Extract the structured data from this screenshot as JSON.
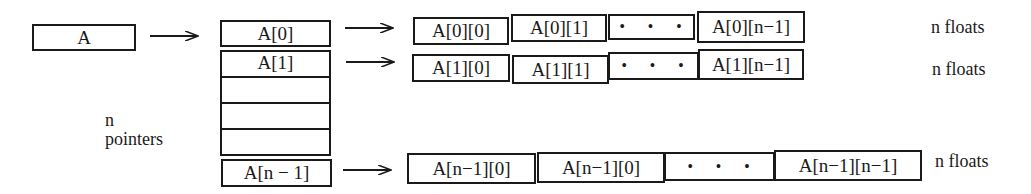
{
  "diagram": {
    "root": {
      "label": "A"
    },
    "pointer_array": {
      "cells": [
        "A[0]",
        "A[1]",
        "",
        "",
        "",
        "A[n − 1]"
      ],
      "caption_line1": "n",
      "caption_line2": "pointers"
    },
    "rows": [
      {
        "cells": [
          "A[0][0]",
          "A[0][1]",
          "• • •",
          "A[0][n−1]"
        ],
        "caption": "n floats"
      },
      {
        "cells": [
          "A[1][0]",
          "A[1][1]",
          "• • •",
          "A[1][n−1]"
        ],
        "caption": "n floats"
      },
      {
        "cells": [
          "A[n−1][0]",
          "A[n−1][0]",
          "• • •",
          "A[n−1][n−1]"
        ],
        "caption": "n floats"
      }
    ],
    "colors": {
      "stroke": "#1a1a1a",
      "background": "#ffffff"
    }
  }
}
